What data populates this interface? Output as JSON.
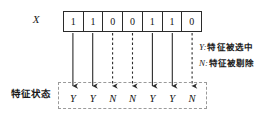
{
  "figure": {
    "title_label": "X",
    "state_label": "特征状态"
  },
  "chromosome": {
    "bits": [
      "1",
      "1",
      "0",
      "0",
      "1",
      "1",
      "0"
    ]
  },
  "feature_states": {
    "values": [
      "Y",
      "Y",
      "N",
      "N",
      "Y",
      "Y",
      "N"
    ]
  },
  "arrows": {
    "styles": [
      "solid",
      "solid",
      "dashed",
      "dashed",
      "solid",
      "solid",
      "dashed"
    ]
  },
  "legend": {
    "items": [
      {
        "key": "Y:",
        "text": "特征被选中"
      },
      {
        "key": "N:",
        "text": "特征被剔除"
      }
    ]
  },
  "colors": {
    "line": "#2b2b2b",
    "dashed_border": "#9a9a9a",
    "text": "#141414",
    "background": "#ffffff"
  }
}
